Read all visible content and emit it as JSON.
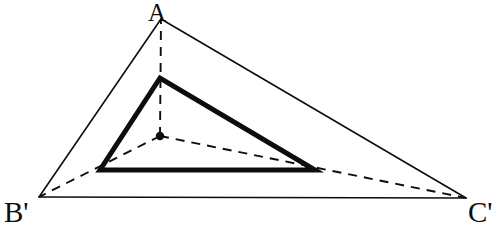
{
  "figure": {
    "width": 504,
    "height": 227,
    "background_color": "#ffffff",
    "stroke_color": "#0d0d0d"
  },
  "labels": {
    "apex": "A",
    "bottom_left": "B'",
    "bottom_right": "C'"
  },
  "chart_data": {
    "type": "diagram",
    "coordinate_system": "pixels, origin top-left",
    "points": [
      {
        "name": "A",
        "label": "A",
        "x": 161,
        "y": 19,
        "role": "outer-vertex-apex"
      },
      {
        "name": "B'",
        "label": "B'",
        "x": 39,
        "y": 197,
        "role": "outer-vertex-bottom-left"
      },
      {
        "name": "C'",
        "label": "C'",
        "x": 466,
        "y": 198,
        "role": "outer-vertex-bottom-right"
      },
      {
        "name": "P",
        "label": "",
        "x": 160,
        "y": 78,
        "role": "inner-vertex-apex"
      },
      {
        "name": "Q",
        "label": "",
        "x": 100,
        "y": 170,
        "role": "inner-vertex-bottom-left"
      },
      {
        "name": "R",
        "label": "",
        "x": 315,
        "y": 170,
        "role": "inner-vertex-bottom-right"
      },
      {
        "name": "O",
        "label": "",
        "x": 160,
        "y": 136,
        "role": "center-point-marker"
      }
    ],
    "shapes": [
      {
        "name": "outer-triangle",
        "kind": "polygon",
        "vertices": [
          "A",
          "B'",
          "C'"
        ],
        "stroke_style": "solid",
        "stroke_width": 1.6,
        "fill": "none"
      },
      {
        "name": "inner-triangle",
        "kind": "polygon",
        "vertices": [
          "P",
          "Q",
          "R"
        ],
        "stroke_style": "solid",
        "stroke_width": 5,
        "fill": "none"
      }
    ],
    "dashed_segments": [
      {
        "name": "cevian-center-to-A",
        "from": "O",
        "to": "A",
        "passes_through": "P"
      },
      {
        "name": "cevian-center-to-Bp",
        "from": "O",
        "to": "B'",
        "passes_through": "Q"
      },
      {
        "name": "cevian-center-to-Cp",
        "from": "O",
        "to": "C'",
        "passes_through": "R"
      }
    ],
    "markers": [
      {
        "name": "center-dot",
        "at": "O",
        "radius": 4.2,
        "fill": "#0d0d0d"
      }
    ],
    "legend": [],
    "grid": false
  }
}
